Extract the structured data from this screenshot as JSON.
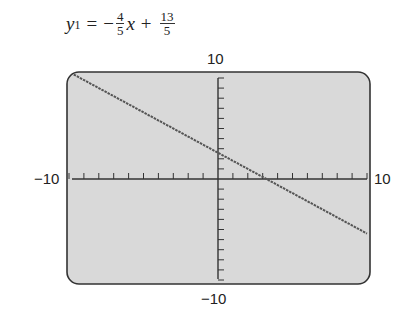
{
  "equation": {
    "lhs_var": "y",
    "lhs_sub": "1",
    "equals": "=",
    "minus": "−",
    "slope_num": "4",
    "slope_den": "5",
    "x_var": "x",
    "plus": "+",
    "intercept_num": "13",
    "intercept_den": "5"
  },
  "labels": {
    "ymax": "10",
    "ymin": "−10",
    "xmin": "−10",
    "xmax": "10"
  },
  "colors": {
    "screen_bg": "#d9d9d9",
    "screen_border": "#333333",
    "axis": "#333333",
    "line": "#555555"
  },
  "chart_data": {
    "type": "line",
    "xlabel": "",
    "ylabel": "",
    "xlim": [
      -10,
      10
    ],
    "ylim": [
      -10,
      10
    ],
    "x_ticks_step": 1,
    "y_ticks_step": 1,
    "grid": false,
    "series": [
      {
        "name": "y1",
        "equation": "y = -0.8x + 2.6",
        "slope": -0.8,
        "intercept": 2.6,
        "x": [
          -10,
          -5,
          0,
          3.25,
          5,
          10
        ],
        "y": [
          10.6,
          6.6,
          2.6,
          0,
          -1.4,
          -5.4
        ]
      }
    ]
  }
}
